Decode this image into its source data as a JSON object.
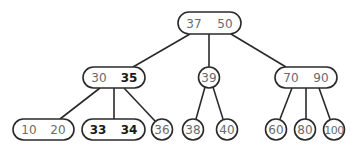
{
  "diagram": {
    "type": "2-3 tree",
    "nodes": [
      {
        "id": "root",
        "keys": [
          "37",
          "50"
        ],
        "bold": [
          false,
          false
        ],
        "shape": "pill",
        "x": 178,
        "y": 12,
        "w": 63,
        "h": 22
      },
      {
        "id": "n30_35",
        "keys": [
          "30",
          "35"
        ],
        "bold": [
          false,
          true
        ],
        "shape": "pill",
        "x": 83,
        "y": 67,
        "w": 62,
        "h": 21
      },
      {
        "id": "n39",
        "keys": [
          "39"
        ],
        "bold": [
          false
        ],
        "shape": "circle",
        "cx": 209,
        "cy": 77.5,
        "r": 10.5
      },
      {
        "id": "n70_90",
        "keys": [
          "70",
          "90"
        ],
        "bold": [
          false,
          false
        ],
        "shape": "pill",
        "x": 275,
        "y": 67,
        "w": 62,
        "h": 21
      },
      {
        "id": "n10_20",
        "keys": [
          "10",
          "20"
        ],
        "bold": [
          false,
          false
        ],
        "shape": "pill",
        "x": 13,
        "y": 119,
        "w": 61,
        "h": 21
      },
      {
        "id": "n33_34",
        "keys": [
          "33",
          "34"
        ],
        "bold": [
          true,
          true
        ],
        "shape": "pill",
        "x": 82,
        "y": 119,
        "w": 63,
        "h": 21
      },
      {
        "id": "n36",
        "keys": [
          "36"
        ],
        "bold": [
          false
        ],
        "shape": "circle",
        "cx": 162,
        "cy": 129.5,
        "r": 10.5
      },
      {
        "id": "n38",
        "keys": [
          "38"
        ],
        "bold": [
          false
        ],
        "shape": "circle",
        "cx": 193,
        "cy": 129.5,
        "r": 10.5
      },
      {
        "id": "n40",
        "keys": [
          "40"
        ],
        "bold": [
          false
        ],
        "shape": "circle",
        "cx": 227,
        "cy": 129.5,
        "r": 10.5
      },
      {
        "id": "n60",
        "keys": [
          "60"
        ],
        "bold": [
          false
        ],
        "shape": "circle",
        "cx": 276,
        "cy": 129.5,
        "r": 10.5
      },
      {
        "id": "n80",
        "keys": [
          "80"
        ],
        "bold": [
          false
        ],
        "shape": "circle",
        "cx": 305,
        "cy": 129.5,
        "r": 10.5
      },
      {
        "id": "n100",
        "keys": [
          "100"
        ],
        "bold": [
          false
        ],
        "shape": "circle",
        "cx": 334,
        "cy": 129.5,
        "r": 10.5
      }
    ],
    "edges": [
      {
        "from": "root",
        "to": "n30_35",
        "x1": 190,
        "y1": 34,
        "x2": 133,
        "y2": 67
      },
      {
        "from": "root",
        "to": "n39",
        "x1": 209,
        "y1": 34,
        "x2": 209,
        "y2": 67
      },
      {
        "from": "root",
        "to": "n70_90",
        "x1": 231,
        "y1": 34,
        "x2": 286,
        "y2": 67
      },
      {
        "from": "n30_35",
        "to": "n10_20",
        "x1": 100,
        "y1": 88,
        "x2": 60,
        "y2": 119
      },
      {
        "from": "n30_35",
        "to": "n33_34",
        "x1": 114,
        "y1": 88,
        "x2": 114,
        "y2": 119
      },
      {
        "from": "n30_35",
        "to": "n36",
        "x1": 124,
        "y1": 88,
        "x2": 155,
        "y2": 121
      },
      {
        "from": "n39",
        "to": "n38",
        "x1": 205,
        "y1": 87,
        "x2": 196,
        "y2": 119
      },
      {
        "from": "n39",
        "to": "n40",
        "x1": 213,
        "y1": 87,
        "x2": 223,
        "y2": 119
      },
      {
        "from": "n70_90",
        "to": "n60",
        "x1": 292,
        "y1": 88,
        "x2": 280,
        "y2": 119
      },
      {
        "from": "n70_90",
        "to": "n80",
        "x1": 306,
        "y1": 88,
        "x2": 306,
        "y2": 119
      },
      {
        "from": "n70_90",
        "to": "n100",
        "x1": 319,
        "y1": 88,
        "x2": 330,
        "y2": 119
      }
    ]
  }
}
